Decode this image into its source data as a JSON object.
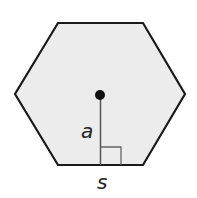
{
  "diagram": {
    "shape": "regular hexagon",
    "fill_color": "#ececec",
    "stroke_color": "#1a1a1a",
    "labels": {
      "apothem": "a",
      "side": "s"
    },
    "annotations": [
      "center point",
      "apothem segment",
      "right-angle marker"
    ]
  }
}
